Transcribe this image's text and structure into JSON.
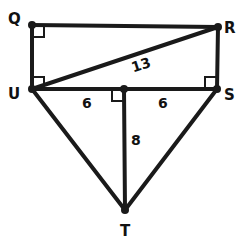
{
  "diagram": {
    "title": "",
    "colors": {
      "stroke": "#1a1a1a",
      "background": "#ffffff",
      "text": "#111111"
    },
    "points": {
      "Q": {
        "label": "Q",
        "x": 32,
        "y": 25
      },
      "R": {
        "label": "R",
        "x": 218,
        "y": 27
      },
      "U": {
        "label": "U",
        "x": 32,
        "y": 89
      },
      "S": {
        "label": "S",
        "x": 217,
        "y": 89
      },
      "M": {
        "label": "",
        "x": 124,
        "y": 89
      },
      "T": {
        "label": "T",
        "x": 125,
        "y": 210
      }
    },
    "segments": [
      {
        "from": "Q",
        "to": "R"
      },
      {
        "from": "Q",
        "to": "U"
      },
      {
        "from": "R",
        "to": "S"
      },
      {
        "from": "U",
        "to": "S"
      },
      {
        "from": "U",
        "to": "R",
        "measure": "13"
      },
      {
        "from": "U",
        "to": "T"
      },
      {
        "from": "S",
        "to": "T"
      },
      {
        "from": "M",
        "to": "T",
        "measure": "8"
      }
    ],
    "measures": {
      "UR": "13",
      "UM": "6",
      "MS": "6",
      "MT": "8"
    },
    "right_angles": [
      "Q",
      "U",
      "S",
      "M"
    ]
  }
}
